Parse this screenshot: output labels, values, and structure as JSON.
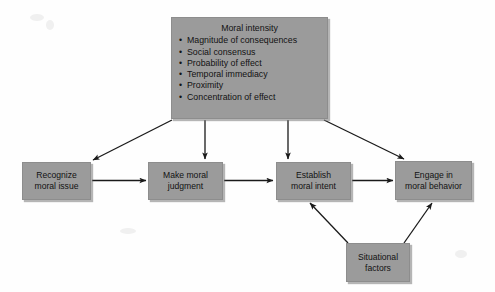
{
  "diagram": {
    "type": "flow-diagram",
    "nodes": {
      "moral_intensity": {
        "title": "Moral intensity",
        "bullets": [
          "Magnitude of consequences",
          "Social consensus",
          "Probability of effect",
          "Temporal immediacy",
          "Proximity",
          "Concentration of effect"
        ]
      },
      "recognize": {
        "line1": "Recognize",
        "line2": "moral issue"
      },
      "judgment": {
        "line1": "Make moral",
        "line2": "judgment"
      },
      "intent": {
        "line1": "Establish",
        "line2": "moral intent"
      },
      "behavior": {
        "line1": "Engage in",
        "line2": "moral behavior"
      },
      "situational": {
        "line1": "Situational",
        "line2": "factors"
      }
    },
    "colors": {
      "box_fill": "#9b9b9b",
      "box_border": "#8d8d8d",
      "arrow": "#1a1a1a",
      "background": "#fefefe",
      "text": "#121212"
    },
    "edges": [
      {
        "from": "moral_intensity",
        "to": "recognize"
      },
      {
        "from": "moral_intensity",
        "to": "judgment"
      },
      {
        "from": "moral_intensity",
        "to": "intent"
      },
      {
        "from": "moral_intensity",
        "to": "behavior"
      },
      {
        "from": "recognize",
        "to": "judgment"
      },
      {
        "from": "judgment",
        "to": "intent"
      },
      {
        "from": "intent",
        "to": "behavior"
      },
      {
        "from": "situational",
        "to": "intent"
      },
      {
        "from": "situational",
        "to": "behavior"
      }
    ]
  }
}
